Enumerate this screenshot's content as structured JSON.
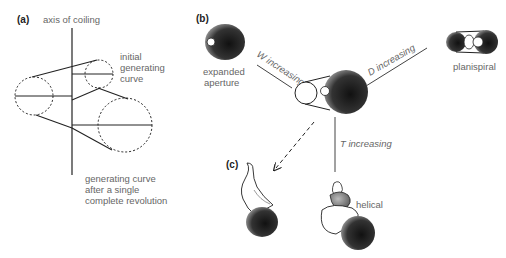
{
  "panels": {
    "a": {
      "label": "(a)",
      "axis_label": "axis of coiling",
      "initial_curve_label": [
        "initial",
        "generating",
        "curve"
      ],
      "final_curve_label": [
        "generating curve",
        "after a single",
        "complete revolution"
      ]
    },
    "b": {
      "label": "(b)",
      "expanded_label": [
        "expanded",
        "aperture"
      ],
      "w_label": "W increasing",
      "d_label": "D increasing",
      "t_label": "T increasing",
      "planispiral_label": "planispiral",
      "helical_label": "helical"
    },
    "c": {
      "label": "(c)"
    }
  },
  "colors": {
    "line": "#222222",
    "shade": "#333333",
    "text": "#666666"
  }
}
